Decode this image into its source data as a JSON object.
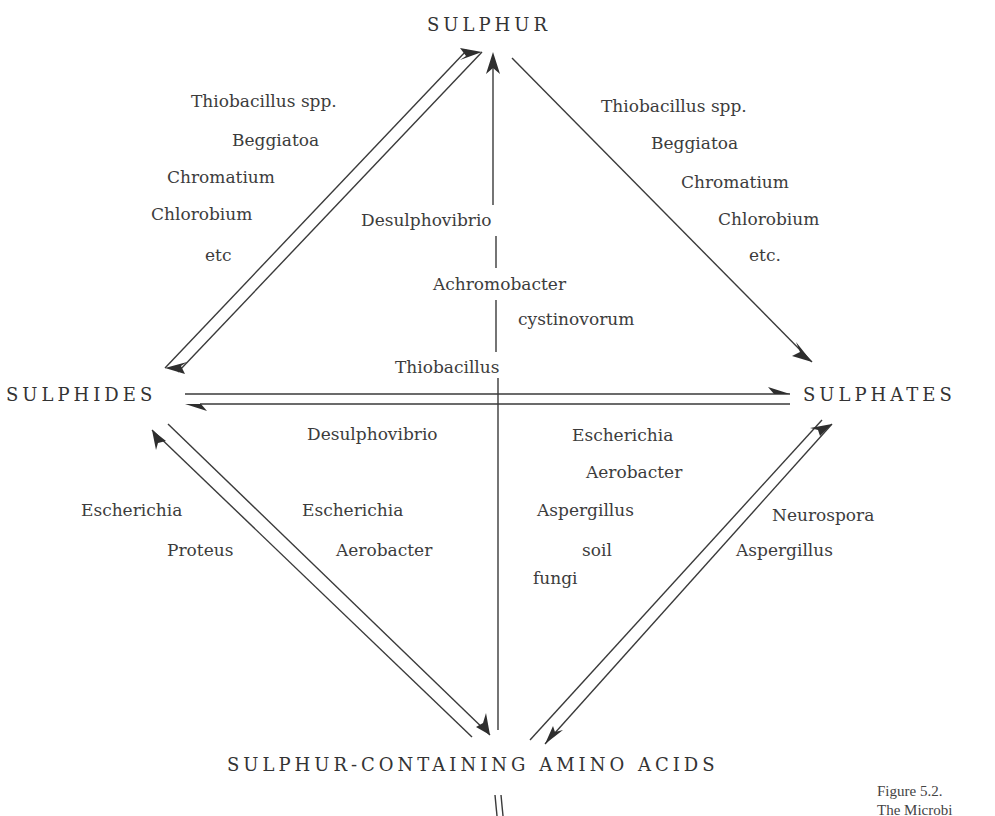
{
  "nodes": {
    "sulphur": "SULPHUR",
    "sulphides": "SULPHIDES",
    "sulphates": "SULPHATES",
    "amino_acids": "SULPHUR-CONTAINING AMINO ACIDS"
  },
  "edges": {
    "sulphides_to_sulphur": [
      "Thiobacillus spp.",
      "Beggiatoa",
      "Chromatium",
      "Chlorobium",
      "etc"
    ],
    "sulphur_to_sulphates": [
      "Thiobacillus spp.",
      "Beggiatoa",
      "Chromatium",
      "Chlorobium",
      "etc."
    ],
    "amino_acids_to_sulphur": [
      "Desulphovibrio",
      "Achromobacter",
      "cystinovorum"
    ],
    "sulphides_to_sulphates": [
      "Thiobacillus"
    ],
    "sulphates_to_sulphides": [
      "Desulphovibrio"
    ],
    "amino_acids_to_sulphides": [
      "Escherichia",
      "Proteus"
    ],
    "sulphides_to_amino_acids": [
      "Escherichia",
      "Aerobacter"
    ],
    "amino_acids_to_sulphates": [
      "Escherichia",
      "Aerobacter",
      "Aspergillus",
      "soil",
      "fungi"
    ],
    "sulphates_to_amino_acids": [
      "Neurospora",
      "Aspergillus"
    ]
  },
  "caption": {
    "figure": "Figure 5.2.",
    "title_partial": "The Microbi"
  }
}
